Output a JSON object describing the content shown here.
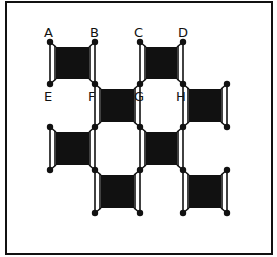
{
  "figure": {
    "frame": {
      "x": 6,
      "y": 2,
      "w": 266,
      "h": 252
    },
    "colors": {
      "ink": "#111111",
      "background": "#ffffff"
    },
    "columns": [
      50,
      95,
      140,
      183,
      227
    ],
    "rows": [
      42,
      84,
      127,
      170,
      213
    ],
    "labels": [
      {
        "text": "A",
        "x": 44,
        "y": 26
      },
      {
        "text": "B",
        "x": 90,
        "y": 26
      },
      {
        "text": "C",
        "x": 134,
        "y": 26
      },
      {
        "text": "D",
        "x": 178,
        "y": 26
      },
      {
        "text": "E",
        "x": 44,
        "y": 90
      },
      {
        "text": "F",
        "x": 88,
        "y": 90
      },
      {
        "text": "G",
        "x": 134,
        "y": 90
      },
      {
        "text": "H",
        "x": 176,
        "y": 90
      }
    ],
    "filled_cells": [
      {
        "col": 0,
        "row": 0
      },
      {
        "col": 2,
        "row": 0
      },
      {
        "col": 1,
        "row": 1
      },
      {
        "col": 3,
        "row": 1
      },
      {
        "col": 0,
        "row": 2
      },
      {
        "col": 2,
        "row": 2
      },
      {
        "col": 1,
        "row": 3
      },
      {
        "col": 3,
        "row": 3
      }
    ]
  }
}
